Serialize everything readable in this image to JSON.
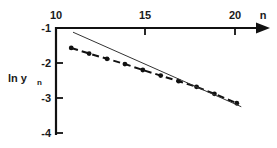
{
  "chart_data": {
    "type": "line",
    "title": "",
    "xlabel": "n",
    "ylabel": "ln y_n",
    "ylabel_base": "ln y",
    "ylabel_sub": "n",
    "xlim": [
      10,
      21.2
    ],
    "ylim": [
      -4,
      -0.85
    ],
    "xticks": [
      10,
      15,
      20
    ],
    "xtick_labels": [
      "10",
      "15",
      "20"
    ],
    "yticks": [
      -1,
      -2,
      -3,
      -4
    ],
    "ytick_labels": [
      "-1",
      "-2",
      "-3",
      "-4"
    ],
    "grid": false,
    "legend": "none",
    "x_axis_position": "top",
    "x_axis_arrow": true,
    "series": [
      {
        "name": "data",
        "style": "dashed-with-markers",
        "marker": "filled-circle",
        "color": "#111111",
        "x": [
          10.85,
          11.85,
          12.85,
          13.85,
          14.85,
          15.85,
          16.85,
          17.85,
          18.85,
          20.1
        ],
        "y": [
          -1.57,
          -1.73,
          -1.88,
          -2.03,
          -2.2,
          -2.36,
          -2.52,
          -2.68,
          -2.88,
          -3.15
        ]
      },
      {
        "name": "reference-line",
        "style": "solid-thin",
        "marker": "none",
        "color": "#333333",
        "x": [
          10.95,
          20.35
        ],
        "y": [
          -1.12,
          -3.25
        ]
      }
    ],
    "annotations": []
  }
}
